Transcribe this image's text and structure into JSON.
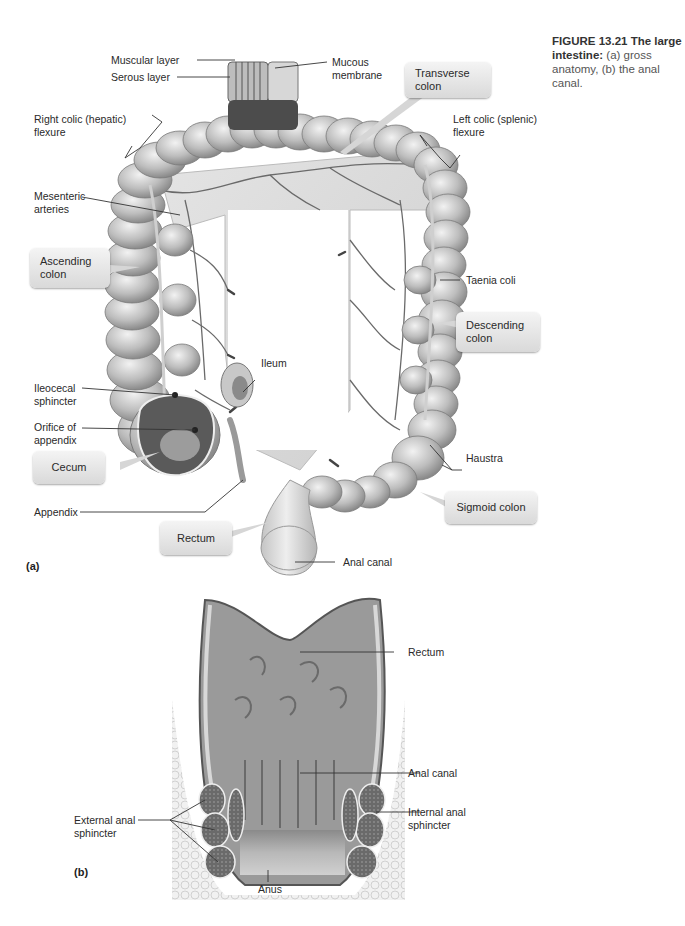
{
  "caption": {
    "figure_number": "FIGURE 13.21",
    "title_bold": "The large intestine:",
    "description": "(a) gross anatomy, (b) the anal canal."
  },
  "panel_a": {
    "tag": "(a)",
    "labels": {
      "muscular_layer": "Muscular layer",
      "serous_layer": "Serous layer",
      "mucous_membrane": "Mucous\nmembrane",
      "right_colic_flexure": "Right colic (hepatic)\nflexure",
      "left_colic_flexure": "Left colic (splenic)\nflexure",
      "mesenteric_arteries": "Mesenteric\narteries",
      "taenia_coli": "Taenia coli",
      "ileum": "Ileum",
      "ileocecal_sphincter": "Ileocecal\nsphincter",
      "orifice_of_appendix": "Orifice of\nappendix",
      "haustra": "Haustra",
      "appendix": "Appendix",
      "anal_canal": "Anal canal"
    },
    "callouts": {
      "transverse_colon": "Transverse\ncolon",
      "ascending_colon": "Ascending\ncolon",
      "descending_colon": "Descending\ncolon",
      "cecum": "Cecum",
      "sigmoid_colon": "Sigmoid colon",
      "rectum": "Rectum"
    }
  },
  "panel_b": {
    "tag": "(b)",
    "labels": {
      "rectum": "Rectum",
      "anal_canal": "Anal canal",
      "internal_anal_sphincter": "Internal anal\nsphincter",
      "external_anal_sphincter": "External anal\nsphincter",
      "anus": "Anus"
    }
  },
  "colors": {
    "tissue_light": "#d8d8d8",
    "tissue_mid": "#a9a9a9",
    "tissue_dark": "#5a5a5a",
    "leader_line": "#333333",
    "callout_bg": "#e6e6e6"
  }
}
